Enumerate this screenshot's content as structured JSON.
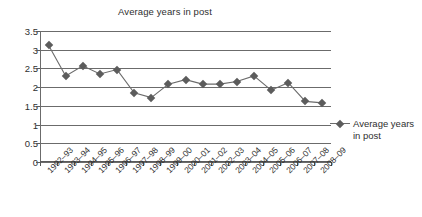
{
  "chart_data": {
    "type": "line",
    "title": "Average years in post",
    "xlabel": "",
    "ylabel": "",
    "ylim": [
      0,
      3.5
    ],
    "yticks": [
      0,
      0.5,
      1,
      1.5,
      2,
      2.5,
      3,
      3.5
    ],
    "ytick_labels": [
      "0",
      "0.5",
      "1",
      "1.5",
      "2",
      "2.5",
      "3",
      "3.5"
    ],
    "grid": true,
    "legend_position": "right",
    "categories": [
      "1992–93",
      "1993–94",
      "1994–95",
      "1995–96",
      "1996–97",
      "1997–98",
      "1998–99",
      "1999–00",
      "2000–01",
      "2001–02",
      "2002–03",
      "2003–04",
      "2004–05",
      "2005–06",
      "2006–07",
      "2007–08",
      "2008–09"
    ],
    "series": [
      {
        "name": "Average years in post",
        "values": [
          3.12,
          2.3,
          2.57,
          2.35,
          2.47,
          1.85,
          1.72,
          2.08,
          2.2,
          2.08,
          2.08,
          2.15,
          2.3,
          1.92,
          2.12,
          1.62,
          1.58
        ]
      }
    ],
    "colors": {
      "series_line": "#6b6b6b",
      "marker": "#5c5c5c",
      "gridline": "#6b6b6b",
      "axis": "#5a5a5a",
      "text": "#2f2f2f",
      "background": "#ffffff"
    }
  },
  "legend": {
    "label": "Average years in post"
  }
}
